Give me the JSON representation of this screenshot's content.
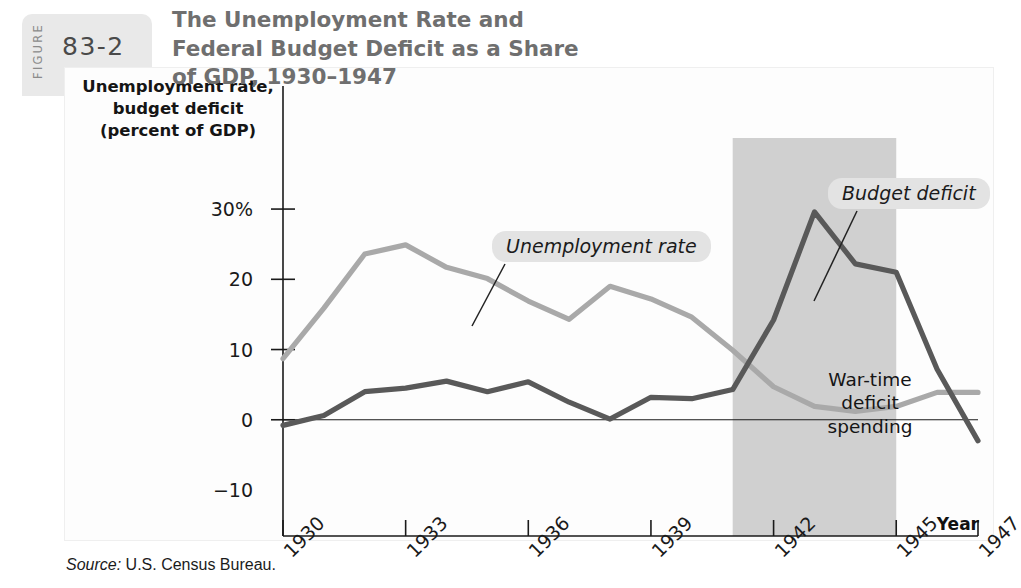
{
  "figure": {
    "word": "FIGURE",
    "number": "83-2",
    "title": "The Unemployment Rate and Federal Budget Deficit as a Share of GDP, 1930–1947",
    "source_word": "Source:",
    "source_text": "U.S. Census Bureau."
  },
  "labels": {
    "y_axis_line1": "Unemployment rate,",
    "y_axis_line2": "budget deficit",
    "y_axis_line3": "(percent of GDP)",
    "x_axis_title": "Year",
    "callout_unemployment": "Unemployment rate",
    "callout_deficit": "Budget deficit",
    "shade_line1": "War-time",
    "shade_line2": "deficit",
    "shade_line3": "spending"
  },
  "colors": {
    "unemployment_line": "#a9a9a9",
    "deficit_line": "#595959",
    "shade_band": "#d0d0d0",
    "axis": "#1a1a1a",
    "title_text": "#6f6f6f",
    "callout_background": "#e3e3e3"
  },
  "chart_data": {
    "type": "line",
    "title": "The Unemployment Rate and Federal Budget Deficit as a Share of GDP, 1930–1947",
    "xlabel": "Year",
    "ylabel": "Unemployment rate, budget deficit (percent of GDP)",
    "xlim": [
      1930,
      1947
    ],
    "ylim": [
      -10,
      33
    ],
    "grid": false,
    "legend_position": "inline-callouts",
    "ytick_labels": [
      "30%",
      "20",
      "10",
      "0",
      "−10"
    ],
    "ytick_values": [
      30,
      20,
      10,
      0,
      -10
    ],
    "xtick_labels": [
      "1930",
      "1933",
      "1936",
      "1939",
      "1942",
      "1945",
      "1947"
    ],
    "xtick_values": [
      1930,
      1933,
      1936,
      1939,
      1942,
      1945,
      1947
    ],
    "x": [
      1930,
      1931,
      1932,
      1933,
      1934,
      1935,
      1936,
      1937,
      1938,
      1939,
      1940,
      1941,
      1942,
      1943,
      1944,
      1945,
      1946,
      1947
    ],
    "series": [
      {
        "name": "Unemployment rate",
        "color": "#a9a9a9",
        "values": [
          8.7,
          15.9,
          23.6,
          24.9,
          21.7,
          20.1,
          16.9,
          14.3,
          19.0,
          17.2,
          14.6,
          9.9,
          4.7,
          1.9,
          1.2,
          1.9,
          3.9,
          3.9
        ]
      },
      {
        "name": "Budget deficit",
        "color": "#595959",
        "values": [
          -0.8,
          0.6,
          4.0,
          4.5,
          5.5,
          4.0,
          5.4,
          2.5,
          0.1,
          3.2,
          3.0,
          4.3,
          14.2,
          29.6,
          22.2,
          21.0,
          7.2,
          -3.0
        ]
      }
    ],
    "annotations": [
      {
        "text": "War-time deficit spending",
        "type": "shaded-band",
        "x_start": 1941,
        "x_end": 1945
      },
      {
        "text": "Unemployment rate",
        "type": "callout",
        "points_to_x": 1935.2,
        "points_to_y": 20.2
      },
      {
        "text": "Budget deficit",
        "type": "callout",
        "points_to_x": 1943.5,
        "points_to_y": 26.5
      }
    ]
  }
}
